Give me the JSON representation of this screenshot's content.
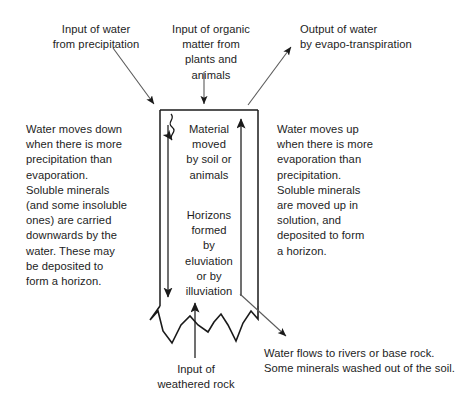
{
  "diagram": {
    "colors": {
      "stroke": "#1a1a1a",
      "text": "#1d1d1d",
      "background": "#ffffff"
    },
    "labels": {
      "precipitation_input": "Input of water\nfrom precipitation",
      "organic_matter_input": "Input of organic\nmatter from\nplants and\nanimals",
      "evapotranspiration_output": "Output of water\nby evapo-transpiration",
      "downward_movement": "Water moves down\nwhen there is more\nprecipitation than\nevaporation.\nSoluble minerals\n(and some insoluble\nones) are carried\ndownwards by the\nwater. These may\nbe deposited to\nform a horizon.",
      "upward_movement": "Water moves up\nwhen there is more\nevaporation than\nprecipitation.\nSoluble minerals\nare moved up in\nsolution, and\ndeposited to form\na horizon.",
      "material_moved": "Material\nmoved\nby soil or\nanimals",
      "horizons_formed": "Horizons\nformed\nby\neluviation\nor by\nilluviation",
      "weathered_rock_input": "Input of\nweathered rock",
      "water_outflow": "Water flows to rivers or base rock.\nSome minerals washed out of the soil."
    },
    "arrows": [
      {
        "name": "precipitation-input-arrow",
        "direction": "down-right"
      },
      {
        "name": "organic-matter-input-arrow",
        "direction": "down"
      },
      {
        "name": "evapotranspiration-output-arrow",
        "direction": "up-right"
      },
      {
        "name": "material-mixing-arrow",
        "direction": "down-left-wiggly"
      },
      {
        "name": "leaching-down-arrow",
        "direction": "down"
      },
      {
        "name": "capillary-up-arrow",
        "direction": "up"
      },
      {
        "name": "weathered-rock-input-arrow",
        "direction": "up"
      },
      {
        "name": "water-outflow-arrow",
        "direction": "down-right"
      }
    ],
    "soil_profile": {
      "name": "soil-profile-box",
      "top": 110,
      "left": 160,
      "right": 258,
      "bottom_jagged": true
    }
  }
}
